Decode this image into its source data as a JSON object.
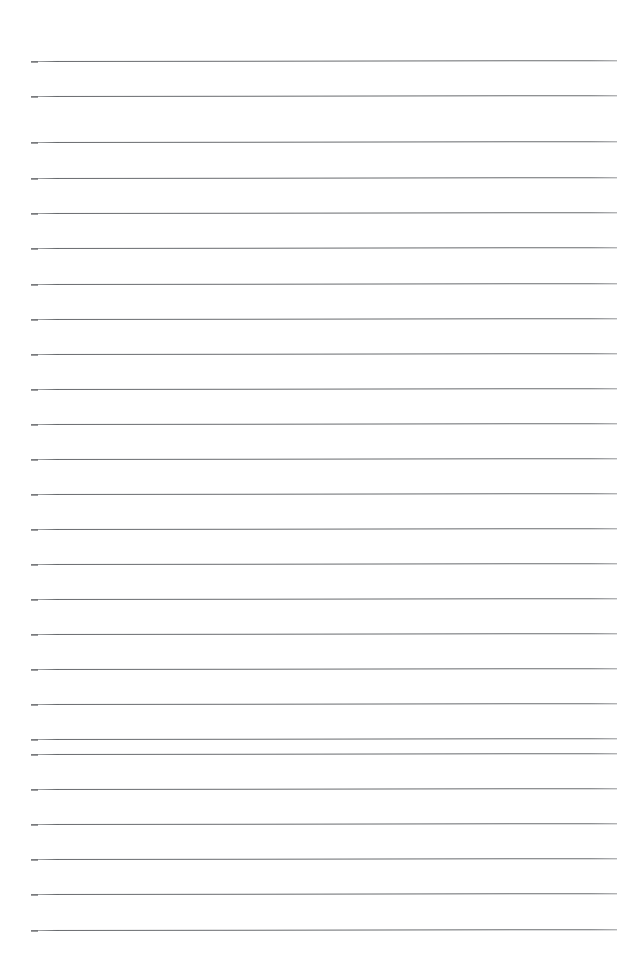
{
  "document": {
    "kind": "scanned-lined-notebook-page",
    "title": "Blank ruled notebook page",
    "page_width": 641,
    "page_height": 966,
    "background_color": "#ffffff",
    "rule_color": "#5c5f63",
    "rule_thickness_px": 1.4,
    "rule_left_x": 31,
    "rule_right_x": 617,
    "rule_length_px": 586,
    "top_margin_px": 61,
    "bottom_margin_px": 36,
    "typical_line_spacing_px": 35,
    "line_count": 26,
    "written_text": "",
    "notes_visible": "none"
  },
  "ruled_lines": [
    {
      "index": 1,
      "y": 61
    },
    {
      "index": 2,
      "y": 96
    },
    {
      "index": 3,
      "y": 142
    },
    {
      "index": 4,
      "y": 178
    },
    {
      "index": 5,
      "y": 213
    },
    {
      "index": 6,
      "y": 248
    },
    {
      "index": 7,
      "y": 284
    },
    {
      "index": 8,
      "y": 319
    },
    {
      "index": 9,
      "y": 354
    },
    {
      "index": 10,
      "y": 389
    },
    {
      "index": 11,
      "y": 424
    },
    {
      "index": 12,
      "y": 459
    },
    {
      "index": 13,
      "y": 494
    },
    {
      "index": 14,
      "y": 529
    },
    {
      "index": 15,
      "y": 564
    },
    {
      "index": 16,
      "y": 599
    },
    {
      "index": 17,
      "y": 634
    },
    {
      "index": 18,
      "y": 669
    },
    {
      "index": 19,
      "y": 704
    },
    {
      "index": 20,
      "y": 739
    },
    {
      "index": 21,
      "y": 754
    },
    {
      "index": 22,
      "y": 789
    },
    {
      "index": 23,
      "y": 824
    },
    {
      "index": 24,
      "y": 859
    },
    {
      "index": 25,
      "y": 894
    },
    {
      "index": 26,
      "y": 930
    }
  ]
}
